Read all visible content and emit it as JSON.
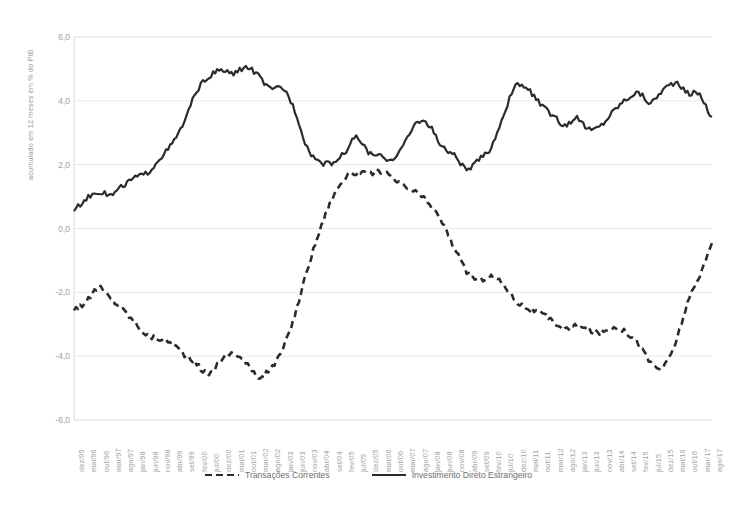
{
  "chart_data": {
    "type": "line",
    "title": "",
    "subtitle": "",
    "xlabel": "",
    "ylabel": "acumulado em 12 meses em % do PIB",
    "ylim": [
      -6.0,
      6.0
    ],
    "yticks": [
      "6,0",
      "4,0",
      "2,0",
      "0,0",
      "-2,0",
      "-4,0",
      "-6,0"
    ],
    "ytick_values": [
      6.0,
      4.0,
      2.0,
      0.0,
      -2.0,
      -4.0,
      -6.0
    ],
    "grid": true,
    "legend_position": "bottom-center",
    "categories": [
      "dez/95",
      "mai/96",
      "out/96",
      "mar/97",
      "ago/97",
      "jan/98",
      "jun/98",
      "nov/98",
      "abr/99",
      "set/99",
      "fev/00",
      "jul/00",
      "dez/00",
      "mai/01",
      "out/01",
      "mar/02",
      "ago/02",
      "jan/03",
      "jun/03",
      "nov/03",
      "abr/04",
      "set/04",
      "fev/05",
      "jul/05",
      "dez/05",
      "mai/06",
      "out/06",
      "mar/07",
      "ago/07",
      "jan/08",
      "jun/08",
      "nov/08",
      "abr/09",
      "set/09",
      "fev/10",
      "jul/10",
      "dez/10",
      "mai/11",
      "out/11",
      "mar/12",
      "ago/12",
      "jan/13",
      "jun/13",
      "nov/13",
      "abr/14",
      "set/14",
      "fev/15",
      "jul/15",
      "dez/15",
      "mai/16",
      "out/16",
      "mar/17",
      "ago/17"
    ],
    "x_start": "dez/95",
    "x_end": "ago/17",
    "x_step_months": 5,
    "series": [
      {
        "name": "Transações Correntes",
        "style": "dashed",
        "color": "#2b2b2b",
        "values": [
          -2.5,
          -2.3,
          -1.85,
          -2.2,
          -2.55,
          -2.95,
          -3.35,
          -3.45,
          -3.6,
          -3.95,
          -4.25,
          -4.55,
          -4.1,
          -3.9,
          -4.2,
          -4.65,
          -4.4,
          -3.8,
          -2.7,
          -1.3,
          -0.1,
          0.9,
          1.55,
          1.75,
          1.7,
          1.8,
          1.55,
          1.3,
          1.1,
          0.75,
          0.2,
          -0.6,
          -1.35,
          -1.6,
          -1.5,
          -1.75,
          -2.25,
          -2.5,
          -2.65,
          -2.9,
          -3.15,
          -3.05,
          -3.2,
          -3.25,
          -3.1,
          -3.25,
          -3.6,
          -4.2,
          -4.35,
          -3.6,
          -2.35,
          -1.5,
          -0.45
        ]
      },
      {
        "name": "Investimento Direto Estrangeiro",
        "style": "solid",
        "color": "#2b2b2b",
        "values": [
          0.6,
          0.95,
          1.15,
          1.05,
          1.35,
          1.6,
          1.75,
          2.2,
          2.65,
          3.35,
          4.3,
          4.75,
          4.95,
          4.85,
          5.05,
          4.8,
          4.35,
          4.4,
          3.7,
          2.55,
          2.1,
          2.05,
          2.35,
          2.85,
          2.4,
          2.25,
          2.2,
          2.7,
          3.35,
          3.2,
          2.55,
          2.3,
          1.85,
          2.15,
          2.55,
          3.55,
          4.45,
          4.35,
          3.9,
          3.55,
          3.25,
          3.45,
          3.1,
          3.25,
          3.7,
          4.05,
          4.25,
          3.95,
          4.35,
          4.55,
          4.25,
          4.2,
          3.5
        ]
      }
    ]
  },
  "legend": {
    "items": [
      {
        "label": "Transações Correntes",
        "style": "dashed"
      },
      {
        "label": "Investimento Direto Estrangeiro",
        "style": "solid"
      }
    ]
  },
  "axis": {
    "y_title": "acumulado em 12 meses em % do PIB"
  },
  "colors": {
    "line": "#2b2b2b",
    "grid": "#e9e9e9",
    "axis_text": "#a2a2a2",
    "background": "#ffffff"
  }
}
